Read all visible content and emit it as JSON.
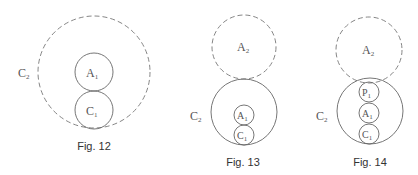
{
  "figures": [
    {
      "caption": "Fig. 12",
      "circles": [
        {
          "label": "C",
          "sub": "2",
          "style": "dashed"
        },
        {
          "label": "A",
          "sub": "1",
          "style": "solid"
        },
        {
          "label": "C",
          "sub": "1",
          "style": "solid"
        }
      ]
    },
    {
      "caption": "Fig. 13",
      "circles": [
        {
          "label": "A",
          "sub": "2",
          "style": "dashed"
        },
        {
          "label": "C",
          "sub": "2",
          "style": "solid"
        },
        {
          "label": "A",
          "sub": "1",
          "style": "solid"
        },
        {
          "label": "C",
          "sub": "1",
          "style": "solid"
        }
      ]
    },
    {
      "caption": "Fig. 14",
      "circles": [
        {
          "label": "A",
          "sub": "2",
          "style": "dashed"
        },
        {
          "label": "C",
          "sub": "2",
          "style": "solid"
        },
        {
          "label": "P",
          "sub": "1",
          "style": "solid"
        },
        {
          "label": "A",
          "sub": "1",
          "style": "solid"
        },
        {
          "label": "C",
          "sub": "1",
          "style": "solid"
        }
      ]
    }
  ]
}
